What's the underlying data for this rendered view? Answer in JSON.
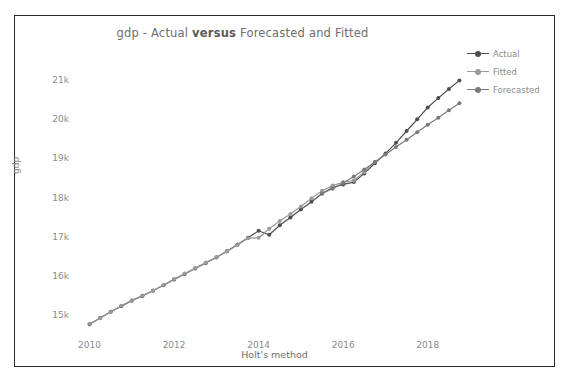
{
  "figure": {
    "background": "#ffffff",
    "border_color": "#2b2b2b"
  },
  "chart_data": {
    "type": "line",
    "title": "gdp - Actual versus Forecasted and Fitted",
    "title_parts": {
      "pre": "gdp - Actual ",
      "emphasis": "versus",
      "post": " Forecasted and Fitted"
    },
    "xlabel": "Holt's method",
    "ylabel": "gdp",
    "grid": false,
    "legend_position": "upper right outside",
    "xlim": [
      2009.75,
      2019.0
    ],
    "ylim": [
      14500,
      21300
    ],
    "xticks": [
      2010,
      2012,
      2014,
      2016,
      2018
    ],
    "xtick_labels": [
      "2010",
      "2012",
      "2014",
      "2016",
      "2018"
    ],
    "yticks": [
      15000,
      16000,
      17000,
      18000,
      19000,
      20000,
      21000
    ],
    "ytick_labels": [
      "15k",
      "16k",
      "17k",
      "18k",
      "19k",
      "20k",
      "21k"
    ],
    "x": [
      2010.0,
      2010.25,
      2010.5,
      2010.75,
      2011.0,
      2011.25,
      2011.5,
      2011.75,
      2012.0,
      2012.25,
      2012.5,
      2012.75,
      2013.0,
      2013.25,
      2013.5,
      2013.75,
      2014.0,
      2014.25,
      2014.5,
      2014.75,
      2015.0,
      2015.25,
      2015.5,
      2015.75,
      2016.0,
      2016.25,
      2016.5,
      2016.75,
      2017.0,
      2017.25,
      2017.5,
      2017.75,
      2018.0,
      2018.25,
      2018.5,
      2018.75
    ],
    "series": [
      {
        "name": "Actual",
        "color": "#4d4d4d",
        "marker": "circle",
        "values": [
          14800,
          14960,
          15120,
          15260,
          15400,
          15520,
          15650,
          15790,
          15940,
          16080,
          16220,
          16360,
          16500,
          16660,
          16830,
          17000,
          17180,
          17080,
          17320,
          17520,
          17720,
          17920,
          18130,
          18280,
          18360,
          18420,
          18640,
          18900,
          19150,
          19420,
          19720,
          20020,
          20320,
          20560,
          20790,
          21010
        ]
      },
      {
        "name": "Fitted",
        "color": "#9a9a9a",
        "marker": "circle",
        "values": [
          14810,
          14950,
          15110,
          15270,
          15410,
          15530,
          15660,
          15800,
          15950,
          16090,
          16230,
          16370,
          16510,
          16650,
          16820,
          16990,
          17000,
          17230,
          17430,
          17610,
          17800,
          18010,
          18200,
          18330,
          18420,
          18460,
          18680,
          18940,
          null,
          null,
          null,
          null,
          null,
          null,
          null,
          null
        ]
      },
      {
        "name": "Forecasted",
        "color": "#7a7a7a",
        "marker": "circle",
        "values": [
          null,
          null,
          null,
          null,
          null,
          null,
          null,
          null,
          null,
          null,
          null,
          null,
          null,
          null,
          null,
          null,
          null,
          null,
          null,
          null,
          null,
          null,
          18130,
          18250,
          18400,
          18560,
          18740,
          18930,
          19120,
          19310,
          19500,
          19690,
          19880,
          20060,
          20250,
          20430
        ]
      }
    ]
  },
  "legend": {
    "items": [
      {
        "label": "Actual",
        "color": "#4d4d4d"
      },
      {
        "label": "Fitted",
        "color": "#9a9a9a"
      },
      {
        "label": "Forecasted",
        "color": "#7a7a7a"
      }
    ]
  }
}
